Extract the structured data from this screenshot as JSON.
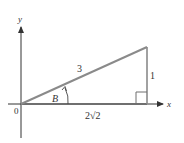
{
  "diagram": {
    "type": "right-triangle-on-axes",
    "axes": {
      "x_label": "x",
      "y_label": "y",
      "origin_label": "0"
    },
    "triangle": {
      "hypotenuse_label": "3",
      "opposite_label": "1",
      "adjacent_label": "2√2",
      "angle_label": "B",
      "right_angle_marker": true
    },
    "colors": {
      "axis": "#333333",
      "triangle_edge": "#8a8a8a",
      "text": "#333333"
    }
  }
}
